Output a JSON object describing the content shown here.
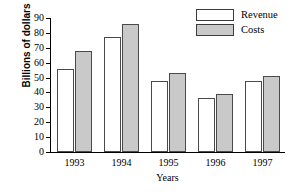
{
  "chart_data": {
    "type": "bar",
    "title": "",
    "xlabel": "Years",
    "ylabel": "Billions of dollars",
    "categories": [
      "1993",
      "1994",
      "1995",
      "1996",
      "1997"
    ],
    "series": [
      {
        "name": "Revenue",
        "color": "#ffffff",
        "values": [
          56,
          77,
          48,
          36,
          48
        ]
      },
      {
        "name": "Costs",
        "color": "#c9c9c9",
        "values": [
          68,
          86,
          53,
          39,
          51
        ]
      }
    ],
    "ylim": [
      0,
      90
    ],
    "ytick_labels": [
      "90",
      "80",
      "70",
      "60",
      "50",
      "40",
      "30",
      "20",
      "10",
      "0"
    ],
    "ytick_values": [
      90,
      80,
      70,
      60,
      50,
      40,
      30,
      20,
      10,
      0
    ],
    "ytick_step": 10,
    "grid": false,
    "legend_position": "top-right",
    "legend_entries": [
      "Revenue",
      "Costs"
    ]
  }
}
